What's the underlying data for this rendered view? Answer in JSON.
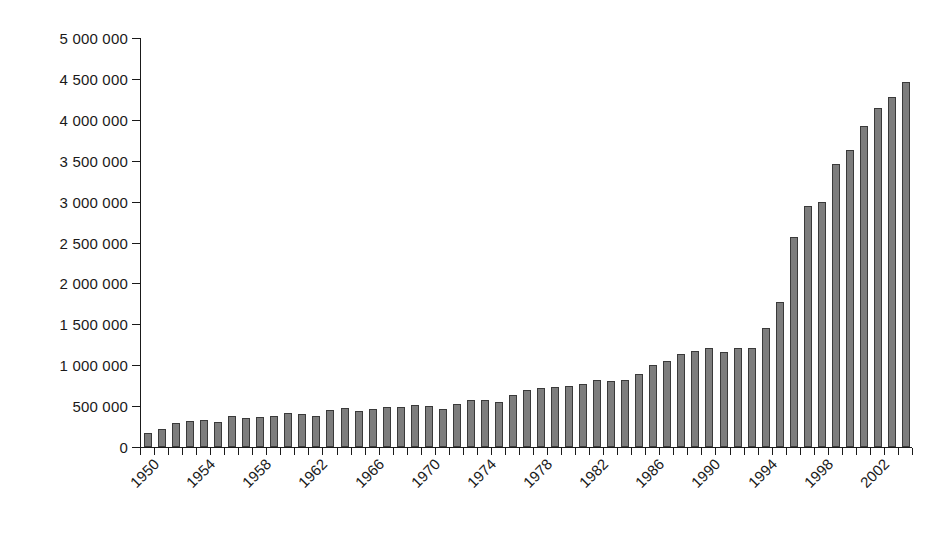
{
  "chart_data": {
    "type": "bar",
    "title": "",
    "subtitle": "",
    "xlabel": "",
    "ylabel": "",
    "grid": false,
    "legend": false,
    "legend_position": "none",
    "bar_color": "#7d7d7d",
    "bar_border_color": "#3a3a3a",
    "axis_color": "#1a1a1a",
    "ylim": [
      0,
      5000000
    ],
    "ytick_step": 500000,
    "ytick_labels": [
      "5 000 000",
      "4 500 000",
      "4 000 000",
      "3 500 000",
      "3 000 000",
      "2 500 000",
      "2 000 000",
      "1 500 000",
      "1 000 000",
      "500 000",
      "0"
    ],
    "ytick_values": [
      5000000,
      4500000,
      4000000,
      3500000,
      3000000,
      2500000,
      2000000,
      1500000,
      1000000,
      500000,
      0
    ],
    "xtick_label_interval": 4,
    "xtick_labels": [
      "1950",
      "1954",
      "1958",
      "1962",
      "1966",
      "1970",
      "1974",
      "1978",
      "1982",
      "1986",
      "1990",
      "1994",
      "1998",
      "2002"
    ],
    "categories": [
      "1950",
      "1951",
      "1952",
      "1953",
      "1954",
      "1955",
      "1956",
      "1957",
      "1958",
      "1959",
      "1960",
      "1961",
      "1962",
      "1963",
      "1964",
      "1965",
      "1966",
      "1967",
      "1968",
      "1969",
      "1970",
      "1971",
      "1972",
      "1973",
      "1974",
      "1975",
      "1976",
      "1977",
      "1978",
      "1979",
      "1980",
      "1981",
      "1982",
      "1983",
      "1984",
      "1985",
      "1986",
      "1987",
      "1988",
      "1989",
      "1990",
      "1991",
      "1992",
      "1993",
      "1994",
      "1995",
      "1996",
      "1997",
      "1998",
      "1999",
      "2000",
      "2001",
      "2002",
      "2003",
      "2004"
    ],
    "values": [
      170000,
      225000,
      290000,
      315000,
      325000,
      310000,
      380000,
      350000,
      365000,
      380000,
      415000,
      405000,
      375000,
      455000,
      480000,
      440000,
      460000,
      485000,
      490000,
      510000,
      500000,
      470000,
      520000,
      580000,
      570000,
      555000,
      640000,
      700000,
      720000,
      730000,
      740000,
      765000,
      820000,
      805000,
      815000,
      890000,
      1000000,
      1050000,
      1135000,
      1170000,
      1215000,
      1165000,
      1215000,
      1205000,
      1460000,
      1770000,
      2570000,
      2945000,
      2990000,
      3460000,
      3630000,
      3930000,
      4140000,
      4280000,
      4465000
    ]
  }
}
